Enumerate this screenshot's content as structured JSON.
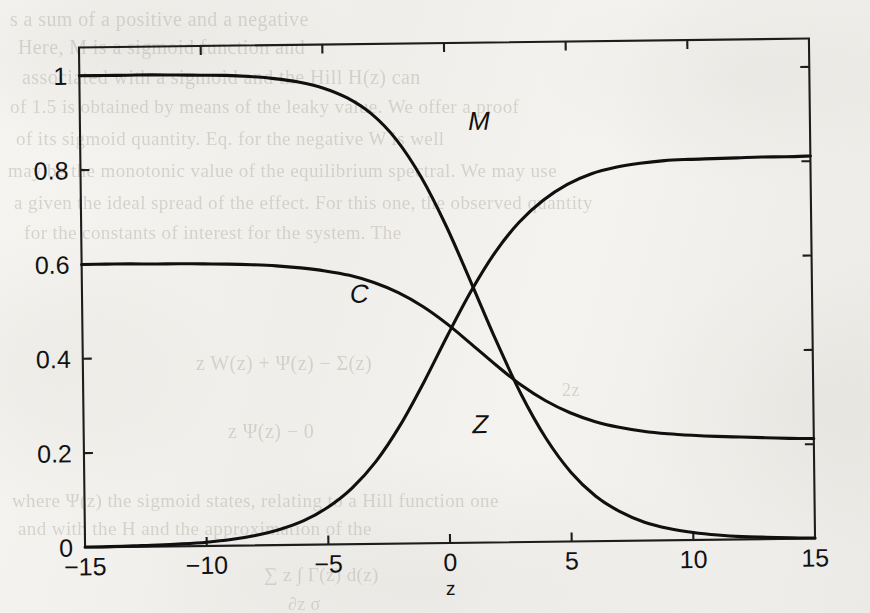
{
  "page": {
    "media": "scanned-book-page",
    "background_color": "#f3f2ef",
    "ink_color": "#101010"
  },
  "figure": {
    "plot_box": {
      "left": 82,
      "top": 43,
      "right": 812,
      "bottom": 543
    },
    "skew_degrees": -0.7
  },
  "chart_data": {
    "type": "line",
    "title": "",
    "subtitle": "",
    "xlabel": "z",
    "ylabel": "",
    "xlim": [
      -15,
      15
    ],
    "ylim": [
      0,
      1.06
    ],
    "xticks": [
      -15,
      -10,
      -5,
      0,
      5,
      10,
      15
    ],
    "xtick_labels": [
      "−15",
      "−10",
      "−5",
      "0",
      "5",
      "10",
      "15"
    ],
    "yticks": [
      0,
      0.2,
      0.4,
      0.6,
      0.8,
      1
    ],
    "ytick_labels": [
      "0",
      "0.2",
      "0.4",
      "0.6",
      "0.8",
      "1"
    ],
    "grid": false,
    "legend": "inline-curve-labels",
    "box": true,
    "x": [
      -15,
      -14,
      -13,
      -12,
      -11,
      -10,
      -9,
      -8,
      -7,
      -6,
      -5,
      -4,
      -3,
      -2,
      -1,
      0,
      1,
      2,
      3,
      4,
      5,
      6,
      7,
      8,
      9,
      10,
      11,
      12,
      13,
      14,
      15
    ],
    "series": [
      {
        "name": "M",
        "label": "M",
        "label_position": {
          "x": 1.4,
          "y": 0.875
        },
        "left_asymptote": 1.0,
        "right_asymptote": 0.0,
        "values": [
          1.0,
          1.0,
          1.0,
          1.0,
          0.999,
          0.998,
          0.997,
          0.994,
          0.989,
          0.981,
          0.968,
          0.946,
          0.911,
          0.856,
          0.776,
          0.672,
          0.551,
          0.427,
          0.313,
          0.219,
          0.147,
          0.096,
          0.062,
          0.039,
          0.025,
          0.016,
          0.01,
          0.006,
          0.004,
          0.002,
          0.001
        ]
      },
      {
        "name": "C",
        "label": "C",
        "label_position": {
          "x": -3.6,
          "y": 0.512
        },
        "left_asymptote": 0.6,
        "right_asymptote": 0.21,
        "values": [
          0.6,
          0.6,
          0.6,
          0.599,
          0.599,
          0.598,
          0.597,
          0.595,
          0.592,
          0.587,
          0.58,
          0.57,
          0.554,
          0.532,
          0.502,
          0.464,
          0.42,
          0.375,
          0.333,
          0.299,
          0.273,
          0.254,
          0.241,
          0.232,
          0.226,
          0.222,
          0.219,
          0.217,
          0.215,
          0.213,
          0.212
        ]
      },
      {
        "name": "Z",
        "label": "Z",
        "label_position": {
          "x": 1.3,
          "y": 0.232
        },
        "left_asymptote": 0.0,
        "right_asymptote": 0.81,
        "values": [
          0.001,
          0.001,
          0.002,
          0.003,
          0.005,
          0.008,
          0.013,
          0.021,
          0.033,
          0.051,
          0.079,
          0.119,
          0.175,
          0.25,
          0.341,
          0.44,
          0.534,
          0.615,
          0.678,
          0.724,
          0.757,
          0.779,
          0.792,
          0.8,
          0.805,
          0.807,
          0.808,
          0.809,
          0.81,
          0.81,
          0.811
        ]
      }
    ]
  },
  "bleed_through_text": [
    {
      "text": "s a sum of a positive and a negative",
      "x": 10,
      "y": 8,
      "size": 20
    },
    {
      "text": "Here, M is a sigmoid function and",
      "x": 18,
      "y": 36,
      "size": 20
    },
    {
      "text": "associated with a sigmoid and the Hill  H(z) can",
      "x": 22,
      "y": 66,
      "size": 20
    },
    {
      "text": "of 1.5 is obtained by means of the leaky value. We offer a proof",
      "x": 10,
      "y": 96,
      "size": 19
    },
    {
      "text": "of its sigmoid quantity. Eq. for the negative W  is  well",
      "x": 16,
      "y": 128,
      "size": 19
    },
    {
      "text": "may be the monotonic value of the equilibrium spectral. We may use",
      "x": 8,
      "y": 160,
      "size": 19
    },
    {
      "text": "a given the ideal spread of the effect. For this one, the observed quantity",
      "x": 14,
      "y": 192,
      "size": 19
    },
    {
      "text": "for the constants of interest for the system. The",
      "x": 24,
      "y": 222,
      "size": 19
    },
    {
      "text": "z   W(z)   +   Ψ(z)   −   Σ(z)",
      "x": 196,
      "y": 352,
      "size": 20
    },
    {
      "text": "2z",
      "x": 562,
      "y": 380,
      "size": 18
    },
    {
      "text": "z   Ψ(z)   −   0",
      "x": 228,
      "y": 420,
      "size": 20
    },
    {
      "text": "where   Ψ(z)   the  sigmoid  states,  relating  to  a  Hill  function  one",
      "x": 12,
      "y": 490,
      "size": 19
    },
    {
      "text": "and   with   the   H   and   the  approximation  of  the",
      "x": 18,
      "y": 518,
      "size": 19
    },
    {
      "text": "∑   z        ∫  Γ(z)  d(z)",
      "x": 264,
      "y": 564,
      "size": 19
    },
    {
      "text": "∂z                       σ",
      "x": 288,
      "y": 594,
      "size": 18
    }
  ]
}
